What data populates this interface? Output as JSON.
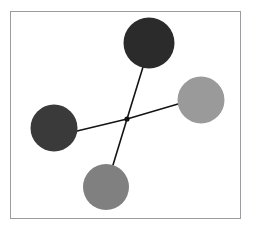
{
  "figure": {
    "background_color": "#ffffff",
    "frame": {
      "x": 10,
      "y": 11,
      "width": 231,
      "height": 208,
      "border_color": "#9c9ca0",
      "border_width": 1
    }
  },
  "chart_data": {
    "type": "scatter",
    "title": "",
    "subtitle": "",
    "xlabel": "",
    "ylabel": "",
    "grid": false,
    "legend": null,
    "axis_ticks": [],
    "layout": "star-graph / node-link diagram with central hub",
    "xlim": [
      10,
      241
    ],
    "ylim": [
      11,
      219
    ],
    "hub": {
      "label": "center-hub",
      "x": 127,
      "y": 119,
      "radius": 2.6,
      "color": "#101010"
    },
    "nodes": [
      {
        "label": "top-node",
        "x": 149,
        "y": 43,
        "radius": 25.5,
        "diameter": 51,
        "color": "#2b2b2b",
        "shade": "very dark gray"
      },
      {
        "label": "left-node",
        "x": 54,
        "y": 128,
        "radius": 23.5,
        "diameter": 47,
        "color": "#3a3a3a",
        "shade": "dark gray"
      },
      {
        "label": "right-node",
        "x": 201,
        "y": 100,
        "radius": 23.5,
        "diameter": 47,
        "color": "#9a9a9a",
        "shade": "light gray"
      },
      {
        "label": "bottom-node",
        "x": 106,
        "y": 187,
        "radius": 23,
        "diameter": 46,
        "color": "#808080",
        "shade": "medium gray"
      }
    ],
    "edges": [
      {
        "label": "hub-to-top",
        "from": "center-hub",
        "to": "top-node",
        "x1": 127,
        "y1": 119,
        "x2": 143,
        "y2": 67,
        "color": "#141414",
        "width": 1.6
      },
      {
        "label": "hub-to-left",
        "from": "center-hub",
        "to": "left-node",
        "x1": 127,
        "y1": 119,
        "x2": 77,
        "y2": 131,
        "color": "#141414",
        "width": 1.6
      },
      {
        "label": "hub-to-right",
        "from": "center-hub",
        "to": "right-node",
        "x1": 127,
        "y1": 119,
        "x2": 178,
        "y2": 104,
        "color": "#141414",
        "width": 1.6
      },
      {
        "label": "hub-to-bottom",
        "from": "center-hub",
        "to": "bottom-node",
        "x1": 127,
        "y1": 119,
        "x2": 113,
        "y2": 165,
        "color": "#141414",
        "width": 1.6
      }
    ]
  }
}
